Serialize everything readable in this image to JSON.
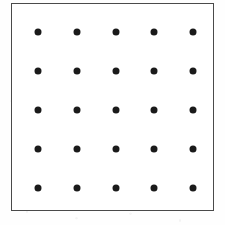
{
  "figure": {
    "canvas": {
      "width": 225,
      "height": 225,
      "background_color": "#fefefe"
    },
    "frame": {
      "name": "dot-grid-box",
      "left": 11,
      "top": 3,
      "right": 214,
      "bottom": 211,
      "border_width": 1,
      "border_color": "#4a4a4a",
      "fill_color": "#ffffff"
    },
    "dot_style": {
      "shape": "circle",
      "diameter": 7,
      "color": "#1a1a1a"
    }
  },
  "chart_data": {
    "type": "scatter",
    "title": "",
    "subtitle": "",
    "xlabel": "",
    "ylabel": "",
    "grid": false,
    "legend": null,
    "rows": 5,
    "columns": 5,
    "point_count": 25,
    "marker": "filled-circle",
    "marker_color": "#1a1a1a",
    "marker_size": 7,
    "xlim": [
      11,
      214
    ],
    "ylim": [
      3,
      211
    ],
    "x_tick_labels": [],
    "y_tick_labels": [],
    "column_centers": [
      38,
      77,
      116,
      154,
      193
    ],
    "row_centers": [
      32,
      71,
      110,
      149,
      188
    ],
    "x": [
      38,
      77,
      116,
      154,
      193,
      38,
      77,
      116,
      154,
      193,
      38,
      77,
      116,
      154,
      193,
      38,
      77,
      116,
      154,
      193,
      38,
      77,
      116,
      154,
      193
    ],
    "y": [
      32,
      32,
      32,
      32,
      32,
      71,
      71,
      71,
      71,
      71,
      110,
      110,
      110,
      110,
      110,
      149,
      149,
      149,
      149,
      149,
      188,
      188,
      188,
      188,
      188
    ],
    "points": [
      {
        "row": 1,
        "col": 1,
        "x": 38,
        "y": 32
      },
      {
        "row": 1,
        "col": 2,
        "x": 77,
        "y": 32
      },
      {
        "row": 1,
        "col": 3,
        "x": 116,
        "y": 32
      },
      {
        "row": 1,
        "col": 4,
        "x": 154,
        "y": 32
      },
      {
        "row": 1,
        "col": 5,
        "x": 193,
        "y": 32
      },
      {
        "row": 2,
        "col": 1,
        "x": 38,
        "y": 71
      },
      {
        "row": 2,
        "col": 2,
        "x": 77,
        "y": 71
      },
      {
        "row": 2,
        "col": 3,
        "x": 116,
        "y": 71
      },
      {
        "row": 2,
        "col": 4,
        "x": 154,
        "y": 71
      },
      {
        "row": 2,
        "col": 5,
        "x": 193,
        "y": 71
      },
      {
        "row": 3,
        "col": 1,
        "x": 38,
        "y": 110
      },
      {
        "row": 3,
        "col": 2,
        "x": 77,
        "y": 110
      },
      {
        "row": 3,
        "col": 3,
        "x": 116,
        "y": 110
      },
      {
        "row": 3,
        "col": 4,
        "x": 154,
        "y": 110
      },
      {
        "row": 3,
        "col": 5,
        "x": 193,
        "y": 110
      },
      {
        "row": 4,
        "col": 1,
        "x": 38,
        "y": 149
      },
      {
        "row": 4,
        "col": 2,
        "x": 77,
        "y": 149
      },
      {
        "row": 4,
        "col": 3,
        "x": 116,
        "y": 149
      },
      {
        "row": 4,
        "col": 4,
        "x": 154,
        "y": 149
      },
      {
        "row": 4,
        "col": 5,
        "x": 193,
        "y": 149
      },
      {
        "row": 5,
        "col": 1,
        "x": 38,
        "y": 188
      },
      {
        "row": 5,
        "col": 2,
        "x": 77,
        "y": 188
      },
      {
        "row": 5,
        "col": 3,
        "x": 116,
        "y": 188
      },
      {
        "row": 5,
        "col": 4,
        "x": 154,
        "y": 188
      },
      {
        "row": 5,
        "col": 5,
        "x": 193,
        "y": 188
      }
    ]
  }
}
